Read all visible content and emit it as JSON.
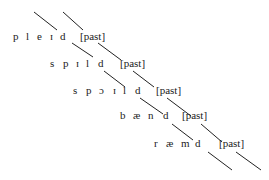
{
  "diagram": {
    "type": "autosegmental-association",
    "rows": [
      {
        "segments": [
          "p",
          "l",
          "e",
          "ɪ",
          "d"
        ],
        "feature": "[past]"
      },
      {
        "segments": [
          "s",
          "p",
          "ɪ",
          "l",
          "d"
        ],
        "feature": "[past]"
      },
      {
        "segments": [
          "s",
          "p",
          "ɔ",
          "ɪ",
          "l",
          "d"
        ],
        "feature": "[past]"
      },
      {
        "segments": [
          "b",
          "æ",
          "n",
          "d"
        ],
        "feature": "[past]"
      },
      {
        "segments": [
          "r",
          "æ",
          "m",
          "d"
        ],
        "feature": "[past]"
      }
    ]
  }
}
